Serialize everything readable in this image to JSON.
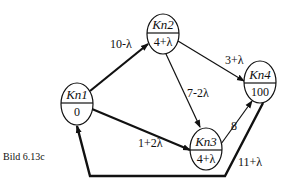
{
  "caption": "Bild 6.13c",
  "nodes": [
    {
      "id": "kn1",
      "name": "Kn1",
      "value": "0",
      "cx": 77,
      "cy": 104
    },
    {
      "id": "kn2",
      "name": "Kn2",
      "value": "4+λ",
      "cx": 163,
      "cy": 34
    },
    {
      "id": "kn3",
      "name": "Kn3",
      "value": "4+λ",
      "cx": 206,
      "cy": 148
    },
    {
      "id": "kn4",
      "name": "Kn4",
      "value": "100",
      "cx": 260,
      "cy": 82
    }
  ],
  "edges": [
    {
      "from": "Kn1",
      "to": "Kn2",
      "label": "10-λ"
    },
    {
      "from": "Kn2",
      "to": "Kn4",
      "label": "3+λ"
    },
    {
      "from": "Kn2",
      "to": "Kn3",
      "label": "7-2λ"
    },
    {
      "from": "Kn1",
      "to": "Kn3",
      "label": "1+2λ"
    },
    {
      "from": "Kn3",
      "to": "Kn4",
      "label": "8"
    },
    {
      "from": "Kn4",
      "to": "Kn1",
      "label": "11+λ"
    }
  ],
  "colors": {
    "stroke": "#111111",
    "background": "#ffffff"
  }
}
